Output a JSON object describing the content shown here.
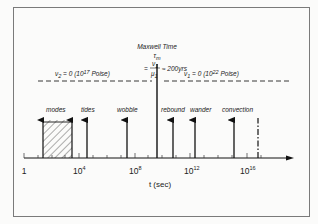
{
  "diagram": {
    "maxwell": {
      "title": "Maxwell Time",
      "symbol": "τ",
      "symbol_sub": "m",
      "eq_prefix": "=",
      "numerator": "ν",
      "numerator_sub": "1",
      "denominator": "μ",
      "denominator_sub": "1",
      "approx": "≈ 200yrs"
    },
    "regimes": {
      "left": {
        "nu": "ν",
        "nu_sub": "2",
        "text": " = 0 (10",
        "exp": "17",
        "unit": " Poise)"
      },
      "right": {
        "nu": "ν",
        "nu_sub": "1",
        "text": " = 0 (10",
        "exp": "22",
        "unit": " Poise)"
      }
    },
    "phenomena": [
      {
        "label": "modes",
        "type": "range"
      },
      {
        "label": "tides",
        "type": "arrow"
      },
      {
        "label": "wobble",
        "type": "arrow"
      },
      {
        "label": "rebound",
        "type": "arrow"
      },
      {
        "label": "wander",
        "type": "arrow"
      },
      {
        "label": "convection",
        "type": "arrow"
      }
    ],
    "axis": {
      "title": "t (sec)",
      "ticks": [
        {
          "base": "1",
          "exp": ""
        },
        {
          "base": "10",
          "exp": "4"
        },
        {
          "base": "10",
          "exp": "8"
        },
        {
          "base": "10",
          "exp": "12"
        },
        {
          "base": "10",
          "exp": "16"
        }
      ]
    }
  }
}
